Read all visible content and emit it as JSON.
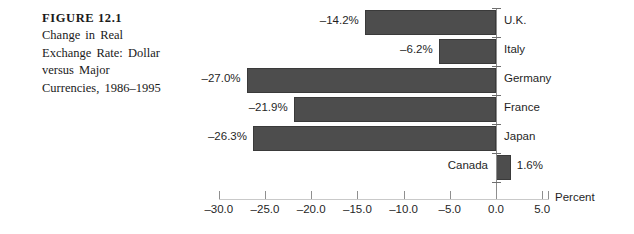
{
  "figure": {
    "number": "FIGURE 12.1",
    "description_lines": [
      "Change in Real",
      "Exchange Rate: Dollar",
      "versus Major",
      "Currencies, 1986–1995"
    ]
  },
  "chart_data": {
    "type": "bar",
    "orientation": "horizontal",
    "title": "Change in Real Exchange Rate: Dollar versus Major Currencies, 1986–1995",
    "xlabel": "Percent",
    "ylabel": "",
    "categories": [
      "U.K.",
      "Italy",
      "Germany",
      "France",
      "Japan",
      "Canada"
    ],
    "values": [
      -14.2,
      -6.2,
      -27.0,
      -21.9,
      -26.3,
      1.6
    ],
    "data_labels": [
      "–14.2%",
      "–6.2%",
      "–27.0%",
      "–21.9%",
      "–26.3%",
      "1.6%"
    ],
    "xlim": [
      -30.0,
      5.0
    ],
    "xticks": [
      -30.0,
      -25.0,
      -20.0,
      -15.0,
      -10.0,
      -5.0,
      0.0,
      5.0
    ],
    "xtick_labels": [
      "–30.0",
      "–25.0",
      "–20.0",
      "–15.0",
      "–10.0",
      "–5.0",
      "0.0",
      "5.0"
    ],
    "grid": false,
    "legend": false,
    "bar_color": "#4d4d4d",
    "axis_color": "#8c8c8c"
  }
}
